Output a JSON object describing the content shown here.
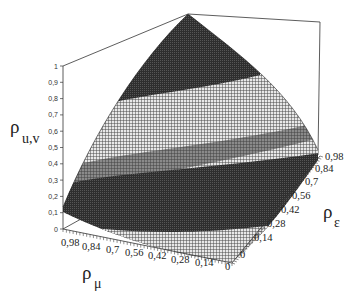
{
  "chart_data": {
    "type": "surface3d",
    "title": "",
    "zlabel": "ρ u,v",
    "zlabel_main": "ρ",
    "zlabel_sub": "u,v",
    "xlabel": "ρ μ",
    "xlabel_main": "ρ",
    "xlabel_sub": "μ",
    "ylabel": "ρ ε",
    "ylabel_main": "ρ",
    "ylabel_sub": "ε",
    "z_ticks": [
      "0",
      "0,1",
      "0,2",
      "0,3",
      "0,4",
      "0,5",
      "0,6",
      "0,7",
      "0,8",
      "0,9",
      "1"
    ],
    "x_ticks": [
      "0,98",
      "0,84",
      "0,7",
      "0,56",
      "0,42",
      "0,28",
      "0,14",
      "0"
    ],
    "y_ticks": [
      "0",
      "0,14",
      "0,28",
      "0,42",
      "0,56",
      "0,7",
      "0,84",
      "0,98"
    ],
    "zlim": [
      0,
      1
    ],
    "xlim": [
      0,
      0.98
    ],
    "ylim": [
      0,
      0.98
    ],
    "surface_description": "Surface rises from ~0 at ρμ=0, ρε=0 to ~1 at ρμ=0.98, ρε=0.98; rendered with alternating dark and light mesh contour bands",
    "sample_points": [
      {
        "rho_mu": 0.98,
        "rho_eps": 0,
        "rho_uv": 0.15
      },
      {
        "rho_mu": 0,
        "rho_eps": 0,
        "rho_uv": 0.0
      },
      {
        "rho_mu": 0,
        "rho_eps": 0.98,
        "rho_uv": 0.15
      },
      {
        "rho_mu": 0.98,
        "rho_eps": 0.98,
        "rho_uv": 1.0
      }
    ],
    "band_colors": [
      "#3a3a3a",
      "#9a9a9a"
    ],
    "grid": false,
    "legend": null
  }
}
